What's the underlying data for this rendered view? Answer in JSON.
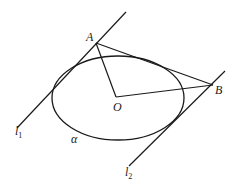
{
  "diagram": {
    "type": "geometry",
    "colors": {
      "stroke": "#1a1a1a",
      "background": "#ffffff"
    },
    "labels": {
      "A": "A",
      "B": "B",
      "O": "O",
      "alpha": "α",
      "l1_main": "l",
      "l1_sub": "1",
      "l2_main": "l",
      "l2_sub": "2"
    },
    "points": {
      "A": [
        96,
        43
      ],
      "B": [
        213,
        85
      ],
      "O": [
        116,
        97
      ]
    },
    "ellipse": {
      "cx": 118,
      "cy": 98,
      "rx": 66,
      "ry": 42
    },
    "lines": {
      "l1": [
        [
          126,
          12
        ],
        [
          17,
          128
        ]
      ],
      "l2": [
        [
          225,
          71
        ],
        [
          129,
          166
        ]
      ],
      "OA": [
        [
          96,
          43
        ],
        [
          116,
          97
        ]
      ],
      "OB": [
        [
          116,
          97
        ],
        [
          213,
          85
        ]
      ],
      "AB": [
        [
          96,
          43
        ],
        [
          213,
          85
        ]
      ]
    }
  }
}
